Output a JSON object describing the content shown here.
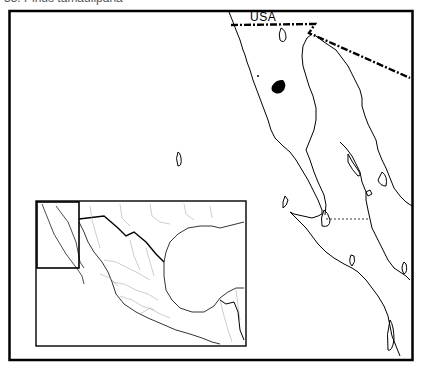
{
  "figure": {
    "title": "33. Pinus tamaulipana",
    "title_visible": "partially cut off at top"
  },
  "map": {
    "region": "Baja California / Gulf of California, Mexico",
    "labels": {
      "country_north": "USA"
    },
    "range_marker": {
      "description": "Solid black distribution patch in northern Baja California",
      "color": "#000000"
    },
    "inset": {
      "description": "Locator map of Mexico with rectangle highlighting Baja California region"
    },
    "colors": {
      "background": "#ffffff",
      "lines": "#000000",
      "inset_internal_borders": "#9a9a9a"
    }
  }
}
